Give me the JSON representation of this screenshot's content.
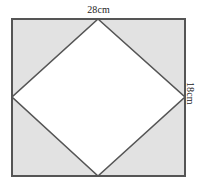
{
  "figure": {
    "kind": "geometry-diagram",
    "canvas": {
      "width": 208,
      "height": 185,
      "background": "#ffffff"
    },
    "colors": {
      "shaded_fill": "#e2e2e2",
      "inner_fill": "#ffffff",
      "stroke": "#555555",
      "text": "#242424"
    },
    "rectangle": {
      "name": "outer-rectangle",
      "left": 12,
      "top": 19,
      "right": 185,
      "bottom": 176,
      "stroke_width": 1.6,
      "fill": "#e2e2e2"
    },
    "rhombus": {
      "name": "inner-rhombus",
      "fill": "#ffffff",
      "stroke_width": 1.6,
      "vertices": [
        {
          "label": "top",
          "x": 98,
          "y": 19
        },
        {
          "label": "right",
          "x": 185,
          "y": 97
        },
        {
          "label": "bottom",
          "x": 98,
          "y": 176
        },
        {
          "label": "left",
          "x": 12,
          "y": 97
        }
      ],
      "points": "98,19 185,97 98,176 12,97"
    },
    "labels": {
      "width": {
        "text": "28cm",
        "value": 28,
        "unit": "cm",
        "edge": "top",
        "rotation": 0
      },
      "height": {
        "text": "18cm",
        "value": 18,
        "unit": "cm",
        "edge": "right",
        "rotation": 90
      }
    }
  }
}
